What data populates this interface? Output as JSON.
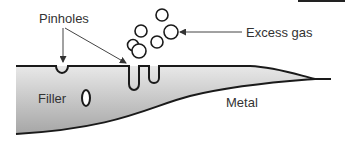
{
  "diagram": {
    "labels": {
      "pinholes": "Pinholes",
      "excess_gas": "Excess gas",
      "filler": "Filler",
      "metal": "Metal"
    },
    "colors": {
      "outline": "#1a1a1a",
      "fill_light": "#e6e6e6",
      "fill_dark": "#a9a9a9",
      "text": "#333333",
      "arrow": "#444444"
    }
  }
}
